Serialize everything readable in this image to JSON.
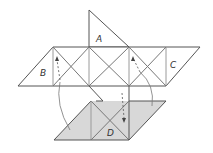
{
  "diagram": {
    "type": "folding-net",
    "labels": {
      "a": "A",
      "b": "B",
      "c": "C",
      "d": "D"
    },
    "colors": {
      "background": "#ffffff",
      "line": "#555555",
      "thin_line": "#9a9a9a",
      "shaded_fill": "#d8d8d8",
      "arrow": "#666666"
    }
  }
}
